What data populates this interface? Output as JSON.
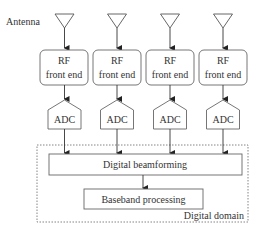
{
  "diagram": {
    "antenna_label": "Antenna",
    "columns": [
      {
        "rf_line1": "RF",
        "rf_line2": "front end",
        "adc": "ADC"
      },
      {
        "rf_line1": "RF",
        "rf_line2": "front end",
        "adc": "ADC"
      },
      {
        "rf_line1": "RF",
        "rf_line2": "front end",
        "adc": "ADC"
      },
      {
        "rf_line1": "RF",
        "rf_line2": "front end",
        "adc": "ADC"
      }
    ],
    "beamforming": "Digital beamforming",
    "baseband": "Baseband processing",
    "domain_label": "Digital domain"
  },
  "colors": {
    "stroke": "#555555",
    "text": "#333333"
  }
}
